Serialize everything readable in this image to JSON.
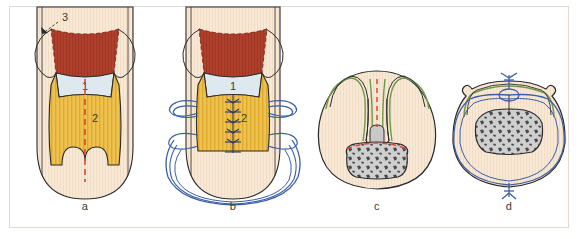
{
  "figure": {
    "background_color": "#ffffff",
    "frame_color": "#e3d9d2",
    "panels": [
      {
        "id": "a",
        "label": "a",
        "view": "longitudinal",
        "description": "Longitudinal view showing planned resection with dashed red midline incision",
        "callouts": [
          {
            "text": "3",
            "target": "upper-left-flap-edge"
          },
          {
            "text": "1",
            "target": "pale-blue-wedge-region"
          },
          {
            "text": "2",
            "target": "striated-yellow-muscle-body"
          }
        ]
      },
      {
        "id": "b",
        "label": "b",
        "view": "longitudinal",
        "description": "Same longitudinal view after midline suture closure with lateral retention sutures",
        "callouts": [
          {
            "text": "1",
            "target": "pale-blue-wedge-region"
          },
          {
            "text": "2",
            "target": "striated-yellow-muscle-body"
          }
        ],
        "suture_stitch_count": 6
      },
      {
        "id": "c",
        "label": "c",
        "view": "cross-section",
        "description": "Cross-section showing green mucosal lining, central stalk and speckled gray core with red dashed incision line",
        "callouts": []
      },
      {
        "id": "d",
        "label": "d",
        "view": "cross-section",
        "description": "Cross-section after closure with blue circumferential suture and two knots",
        "callouts": [],
        "knot_count": 2
      }
    ]
  },
  "colors": {
    "tissue_cream": "#f6e2cd",
    "tissue_cream_light": "#faeedd",
    "muscle_yellow": "#eec24f",
    "muscle_yellow_light": "#f3d684",
    "dark_red": "#b0402c",
    "pale_blue": "#dde8ef",
    "incision_red": "#e2452c",
    "suture_blue": "#3a5fa8",
    "mucosa_green": "#6d9b49",
    "core_gray": "#cfcfcf",
    "core_speckle": "#4a4a4a",
    "outline": "#2b2b2b",
    "label_text": "#3a3a3a"
  }
}
